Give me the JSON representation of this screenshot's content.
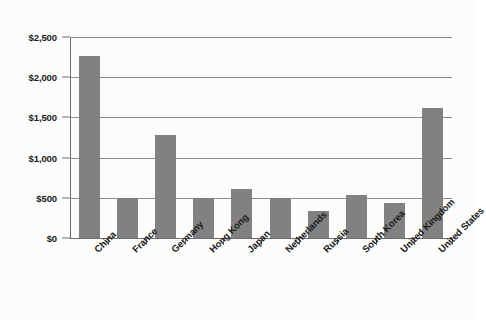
{
  "chart_data": {
    "type": "bar",
    "title": "",
    "subtitle": "",
    "xlabel": "",
    "ylabel": "",
    "categories": [
      "China",
      "France",
      "Germany",
      "Hong Kong",
      "Japan",
      "Netherlands",
      "Russia",
      "South Korea",
      "United Kingdom",
      "United States"
    ],
    "values": [
      2265,
      500,
      1280,
      500,
      610,
      500,
      335,
      535,
      435,
      1615
    ],
    "ylim": [
      0,
      2500
    ],
    "ytick_values": [
      0,
      500,
      1000,
      1500,
      2000,
      2500
    ],
    "ytick_labels": [
      "$0",
      "$500",
      "$1,000",
      "$1,500",
      "$2,000",
      "$2,500"
    ],
    "grid": true,
    "legend": "none",
    "series": [
      {
        "name": "Value",
        "values": [
          2265,
          500,
          1280,
          500,
          610,
          500,
          335,
          535,
          435,
          1615
        ]
      }
    ],
    "colors": {
      "bar": "#818181",
      "gridline": "#8d8d8d",
      "axis": "#6e6e6e",
      "text": "#1a1a1a",
      "background": "#fcfcfc"
    }
  }
}
